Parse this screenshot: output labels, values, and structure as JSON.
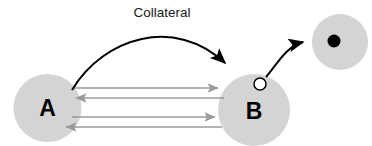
{
  "diagram": {
    "canvas": {
      "width": 372,
      "height": 146,
      "background": "#ffffff"
    },
    "colors": {
      "node_fill": "#d4d4d4",
      "node_stroke": "none",
      "curved_arrow": "#000000",
      "straight_arrow": "#9a9a9a",
      "label_text": "#1a1a1a",
      "node_text": "#000000",
      "marker_open_fill": "#ffffff",
      "marker_open_stroke": "#000000",
      "marker_filled": "#000000"
    },
    "nodes": [
      {
        "id": "A",
        "label": "A",
        "cx": 47.5,
        "cy": 108,
        "rx": 34,
        "ry": 34,
        "fill": "#d4d4d4"
      },
      {
        "id": "B",
        "label": "B",
        "cx": 254,
        "cy": 110,
        "rx": 36,
        "ry": 36,
        "fill": "#d4d4d4"
      },
      {
        "id": "C",
        "label": "",
        "cx": 340,
        "cy": 42,
        "rx": 28,
        "ry": 28,
        "fill": "#d4d4d4"
      }
    ],
    "markers": [
      {
        "id": "open-bouton",
        "kind": "open-circle",
        "cx": 260,
        "cy": 84,
        "r": 6,
        "fill": "#ffffff",
        "stroke": "#000000"
      },
      {
        "id": "filled-bouton",
        "kind": "filled-circle",
        "cx": 334,
        "cy": 41,
        "r": 6.5,
        "fill": "#000000"
      }
    ],
    "edges": [
      {
        "id": "collateral-arc",
        "style": "curved",
        "label": "Collateral",
        "color": "#000000",
        "from": "A",
        "to": "B",
        "arrowhead": "filled-triangle",
        "path": "M 72 90 C 104 37, 175 16, 225 63"
      },
      {
        "id": "b-to-c-arc",
        "style": "curved",
        "label": "",
        "color": "#000000",
        "from": "B",
        "to": "C",
        "arrowhead": "filled-triangle",
        "path": "M 266 77 C 276 66, 286 46, 303 42"
      },
      {
        "id": "reciprocal-1",
        "style": "straight",
        "direction": "A-to-B",
        "color": "#9a9a9a",
        "x1": 74,
        "x2": 218,
        "y": 88
      },
      {
        "id": "reciprocal-2",
        "style": "straight",
        "direction": "B-to-A",
        "color": "#9a9a9a",
        "x1": 224,
        "x2": 76,
        "y": 98
      },
      {
        "id": "reciprocal-3",
        "style": "straight",
        "direction": "A-to-B",
        "color": "#9a9a9a",
        "x1": 72,
        "x2": 215,
        "y": 117
      },
      {
        "id": "reciprocal-4",
        "style": "straight",
        "direction": "B-to-A",
        "color": "#9a9a9a",
        "x1": 222,
        "x2": 66,
        "y": 127
      }
    ],
    "labels": {
      "collateral": "Collateral",
      "collateral_x": 162,
      "collateral_y": 17,
      "node_a": "A",
      "node_b": "B"
    }
  }
}
